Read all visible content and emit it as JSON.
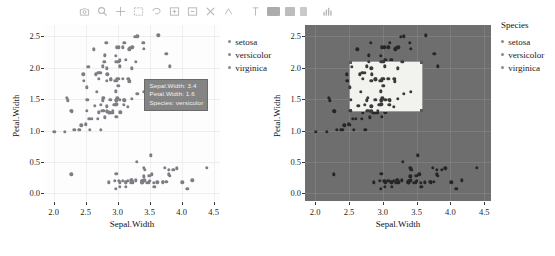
{
  "toolbar": {
    "name": "plotly-modebar",
    "buttons": [
      {
        "name": "camera-icon",
        "title": "Download plot as a png"
      },
      {
        "name": "zoom-icon",
        "title": "Zoom"
      },
      {
        "name": "pan-icon",
        "title": "Pan"
      },
      {
        "name": "box-select-icon",
        "title": "Box Select"
      },
      {
        "name": "lasso-select-icon",
        "title": "Lasso Select"
      },
      {
        "name": "zoom-in-icon",
        "title": "Zoom in"
      },
      {
        "name": "zoom-out-icon",
        "title": "Zoom out"
      },
      {
        "name": "autoscale-icon",
        "title": "Autoscale"
      },
      {
        "name": "reset-axes-icon",
        "title": "Reset axes"
      },
      {
        "name": "toggle-spike-lines-icon",
        "title": "Toggle Spike Lines"
      },
      {
        "name": "hover-compare-icon",
        "title": "Show closest data on hover"
      },
      {
        "name": "hover-closest-icon",
        "title": "Compare data on hover"
      },
      {
        "name": "collaborate-icon",
        "title": "Collaborate"
      },
      {
        "name": "logo-icon",
        "title": "Produced with plotly"
      }
    ]
  },
  "left_chart": {
    "tooltip": {
      "line1": "Sepal.Width: 3.4",
      "line2": "Petal.Width: 1.6",
      "line3": "Species: versicolor"
    },
    "legend": {
      "title": "",
      "items": [
        "setosa",
        "versicolor",
        "virginica"
      ]
    }
  },
  "right_chart": {
    "legend": {
      "title": "Species",
      "items": [
        "setosa",
        "versicolor",
        "virginica"
      ]
    },
    "selection": {
      "x_min": 2.5,
      "x_max": 3.6,
      "y_min": 1.3,
      "y_max": 2.1
    }
  },
  "chart_data": [
    {
      "id": "left-scatter",
      "type": "scatter",
      "title": "",
      "xlabel": "Sepal.Width",
      "ylabel": "Petal.Width",
      "xlim": [
        1.85,
        4.6
      ],
      "ylim": [
        -0.12,
        2.68
      ],
      "xticks": [
        "2.0",
        "2.5",
        "3.0",
        "3.5",
        "4.0",
        "4.5"
      ],
      "xtickvals": [
        2.0,
        2.5,
        3.0,
        3.5,
        4.0,
        4.5
      ],
      "yticks": [
        "0.0",
        "0.5",
        "1.0",
        "1.5",
        "2.0",
        "2.5"
      ],
      "ytickvals": [
        0.0,
        0.5,
        1.0,
        1.5,
        2.0,
        2.5
      ],
      "grid": true,
      "legend_position": "right",
      "marker_color": "#7d7d85",
      "series": [
        {
          "name": "iris",
          "x": [
            3.5,
            3.0,
            3.2,
            3.1,
            3.6,
            3.9,
            3.4,
            3.4,
            2.9,
            3.1,
            3.7,
            3.4,
            3.0,
            3.0,
            4.0,
            4.4,
            3.9,
            3.5,
            3.8,
            3.8,
            3.4,
            3.7,
            3.6,
            3.3,
            3.4,
            3.0,
            3.4,
            3.5,
            3.4,
            3.2,
            3.1,
            3.4,
            4.1,
            4.2,
            3.1,
            3.2,
            3.5,
            3.6,
            3.0,
            3.4,
            3.5,
            2.3,
            3.2,
            3.5,
            3.8,
            3.0,
            3.8,
            3.2,
            3.7,
            3.3,
            3.2,
            3.2,
            3.1,
            2.3,
            2.8,
            2.8,
            3.3,
            2.4,
            2.9,
            2.7,
            2.0,
            3.0,
            2.2,
            2.9,
            2.9,
            3.1,
            3.0,
            2.7,
            2.2,
            2.5,
            3.2,
            2.8,
            2.5,
            2.8,
            2.9,
            3.0,
            2.8,
            3.0,
            2.9,
            2.6,
            2.4,
            2.4,
            2.7,
            2.7,
            3.0,
            3.4,
            3.1,
            2.3,
            3.0,
            2.5,
            2.6,
            3.0,
            2.6,
            2.3,
            2.7,
            3.0,
            2.9,
            2.9,
            2.5,
            2.8,
            3.3,
            2.7,
            3.0,
            2.9,
            3.0,
            3.0,
            2.5,
            2.9,
            2.5,
            3.6,
            3.2,
            2.7,
            3.0,
            2.5,
            2.8,
            3.2,
            3.0,
            3.8,
            2.6,
            2.2,
            3.2,
            2.8,
            2.8,
            2.7,
            3.3,
            3.2,
            2.8,
            3.0,
            2.8,
            3.0,
            2.8,
            3.8,
            2.8,
            2.8,
            2.6,
            3.0,
            3.4,
            3.1,
            3.0,
            3.1,
            3.1,
            3.1,
            2.7,
            3.2,
            3.3,
            3.0,
            2.5,
            3.0,
            3.4,
            3.0
          ],
          "y": [
            0.2,
            0.2,
            0.2,
            0.2,
            0.2,
            0.4,
            0.3,
            0.2,
            0.2,
            0.1,
            0.2,
            0.2,
            0.1,
            0.1,
            0.2,
            0.4,
            0.4,
            0.3,
            0.3,
            0.3,
            0.2,
            0.4,
            0.2,
            0.5,
            0.2,
            0.2,
            0.4,
            0.2,
            0.2,
            0.2,
            0.2,
            0.4,
            0.1,
            0.2,
            0.2,
            0.2,
            0.2,
            0.1,
            0.2,
            0.2,
            0.3,
            0.3,
            0.2,
            0.6,
            0.4,
            0.3,
            0.2,
            0.2,
            0.2,
            0.2,
            1.4,
            1.5,
            1.5,
            1.3,
            1.5,
            1.3,
            1.6,
            1.0,
            1.3,
            1.4,
            1.0,
            1.5,
            1.0,
            1.4,
            1.3,
            1.4,
            1.5,
            1.0,
            1.5,
            1.1,
            1.8,
            1.3,
            1.5,
            1.2,
            1.3,
            1.4,
            1.4,
            1.7,
            1.5,
            1.0,
            1.1,
            1.0,
            1.2,
            1.6,
            1.5,
            1.6,
            1.5,
            1.3,
            1.3,
            1.3,
            1.2,
            1.4,
            1.2,
            1.0,
            1.3,
            1.2,
            1.3,
            1.3,
            1.1,
            1.3,
            2.5,
            1.9,
            2.1,
            1.8,
            2.2,
            2.1,
            1.7,
            1.8,
            1.8,
            2.5,
            2.0,
            1.9,
            2.1,
            2.0,
            2.4,
            2.3,
            1.8,
            2.2,
            2.3,
            1.5,
            2.3,
            2.0,
            2.0,
            1.8,
            2.1,
            1.8,
            1.8,
            1.8,
            2.1,
            1.6,
            1.9,
            2.0,
            2.2,
            1.5,
            1.4,
            2.3,
            2.4,
            1.8,
            1.8,
            2.1,
            2.4,
            2.3,
            1.9,
            2.3,
            2.5,
            2.3,
            1.9,
            2.0,
            2.3,
            1.8
          ]
        }
      ]
    },
    {
      "id": "right-scatter",
      "type": "scatter",
      "title": "",
      "xlabel": "Sepal.Width",
      "ylabel": "Petal.Width",
      "xlim": [
        1.85,
        4.6
      ],
      "ylim": [
        -0.12,
        2.68
      ],
      "xticks": [
        "2.0",
        "2.5",
        "3.0",
        "3.5",
        "4.0",
        "4.5"
      ],
      "xtickvals": [
        2.0,
        2.5,
        3.0,
        3.5,
        4.0,
        4.5
      ],
      "yticks": [
        "0.0",
        "0.5",
        "1.0",
        "1.5",
        "2.0",
        "2.5"
      ],
      "ytickvals": [
        0.0,
        0.5,
        1.0,
        1.5,
        2.0,
        2.5
      ],
      "grid": true,
      "legend_position": "right",
      "panel_color": "#6e6e6e",
      "marker_color": "#262626",
      "series": [
        {
          "name": "iris",
          "x": [
            3.5,
            3.0,
            3.2,
            3.1,
            3.6,
            3.9,
            3.4,
            3.4,
            2.9,
            3.1,
            3.7,
            3.4,
            3.0,
            3.0,
            4.0,
            4.4,
            3.9,
            3.5,
            3.8,
            3.8,
            3.4,
            3.7,
            3.6,
            3.3,
            3.4,
            3.0,
            3.4,
            3.5,
            3.4,
            3.2,
            3.1,
            3.4,
            4.1,
            4.2,
            3.1,
            3.2,
            3.5,
            3.6,
            3.0,
            3.4,
            3.5,
            2.3,
            3.2,
            3.5,
            3.8,
            3.0,
            3.8,
            3.2,
            3.7,
            3.3,
            3.2,
            3.2,
            3.1,
            2.3,
            2.8,
            2.8,
            3.3,
            2.4,
            2.9,
            2.7,
            2.0,
            3.0,
            2.2,
            2.9,
            2.9,
            3.1,
            3.0,
            2.7,
            2.2,
            2.5,
            3.2,
            2.8,
            2.5,
            2.8,
            2.9,
            3.0,
            2.8,
            3.0,
            2.9,
            2.6,
            2.4,
            2.4,
            2.7,
            2.7,
            3.0,
            3.4,
            3.1,
            2.3,
            3.0,
            2.5,
            2.6,
            3.0,
            2.6,
            2.3,
            2.7,
            3.0,
            2.9,
            2.9,
            2.5,
            2.8,
            3.3,
            2.7,
            3.0,
            2.9,
            3.0,
            3.0,
            2.5,
            2.9,
            2.5,
            3.6,
            3.2,
            2.7,
            3.0,
            2.5,
            2.8,
            3.2,
            3.0,
            3.8,
            2.6,
            2.2,
            3.2,
            2.8,
            2.8,
            2.7,
            3.3,
            3.2,
            2.8,
            3.0,
            2.8,
            3.0,
            2.8,
            3.8,
            2.8,
            2.8,
            2.6,
            3.0,
            3.4,
            3.1,
            3.0,
            3.1,
            3.1,
            3.1,
            2.7,
            3.2,
            3.3,
            3.0,
            2.5,
            3.0,
            3.4,
            3.0
          ],
          "y": [
            0.2,
            0.2,
            0.2,
            0.2,
            0.2,
            0.4,
            0.3,
            0.2,
            0.2,
            0.1,
            0.2,
            0.2,
            0.1,
            0.1,
            0.2,
            0.4,
            0.4,
            0.3,
            0.3,
            0.3,
            0.2,
            0.4,
            0.2,
            0.5,
            0.2,
            0.2,
            0.4,
            0.2,
            0.2,
            0.2,
            0.2,
            0.4,
            0.1,
            0.2,
            0.2,
            0.2,
            0.2,
            0.1,
            0.2,
            0.2,
            0.3,
            0.3,
            0.2,
            0.6,
            0.4,
            0.3,
            0.2,
            0.2,
            0.2,
            0.2,
            1.4,
            1.5,
            1.5,
            1.3,
            1.5,
            1.3,
            1.6,
            1.0,
            1.3,
            1.4,
            1.0,
            1.5,
            1.0,
            1.4,
            1.3,
            1.4,
            1.5,
            1.0,
            1.5,
            1.1,
            1.8,
            1.3,
            1.5,
            1.2,
            1.3,
            1.4,
            1.4,
            1.7,
            1.5,
            1.0,
            1.1,
            1.0,
            1.2,
            1.6,
            1.5,
            1.6,
            1.5,
            1.3,
            1.3,
            1.3,
            1.2,
            1.4,
            1.2,
            1.0,
            1.3,
            1.2,
            1.3,
            1.3,
            1.1,
            1.3,
            2.5,
            1.9,
            2.1,
            1.8,
            2.2,
            2.1,
            1.7,
            1.8,
            1.8,
            2.5,
            2.0,
            1.9,
            2.1,
            2.0,
            2.4,
            2.3,
            1.8,
            2.2,
            2.3,
            1.5,
            2.3,
            2.0,
            2.0,
            1.8,
            2.1,
            1.8,
            1.8,
            1.8,
            2.1,
            1.6,
            1.9,
            2.0,
            2.2,
            1.5,
            1.4,
            2.3,
            2.4,
            1.8,
            1.8,
            2.1,
            2.4,
            2.3,
            1.9,
            2.3,
            2.5,
            2.3,
            1.9,
            2.0,
            2.3,
            1.8
          ]
        }
      ]
    }
  ]
}
